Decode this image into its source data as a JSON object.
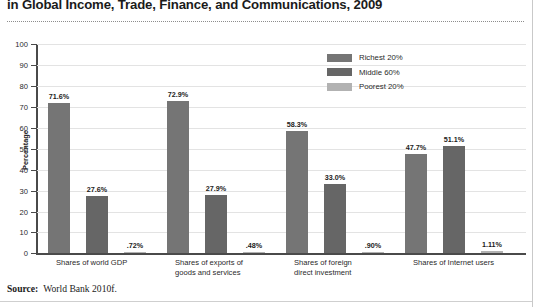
{
  "figure": {
    "title": "in Global Income, Trade, Finance, and Communications, 2009",
    "source_label": "Source:",
    "source_text": "World Bank 2010f."
  },
  "chart_data": {
    "type": "bar",
    "title": "in Global Income, Trade, Finance, and Communications, 2009",
    "xlabel": "",
    "ylabel": "Percentage",
    "ylim": [
      0,
      100
    ],
    "yticks": [
      0,
      10,
      20,
      30,
      40,
      50,
      60,
      70,
      80,
      90,
      100
    ],
    "ytick_labels": [
      "0",
      "10",
      "20",
      "30",
      "40",
      "50",
      "60",
      "70",
      "80",
      "90",
      "100"
    ],
    "grid": true,
    "legend_position": "top-right",
    "categories": [
      "Shares of world GDP",
      "Shares of exports of\ngoods and services",
      "Shares of foreign\ndirect investment",
      "Shares of Internet users"
    ],
    "series": [
      {
        "name": "Richest 20%",
        "color": "#757575",
        "values": [
          71.6,
          72.9,
          58.3,
          47.7
        ],
        "value_labels": [
          "71.6%",
          "72.9%",
          "58.3%",
          "47.7%"
        ]
      },
      {
        "name": "Middle 60%",
        "color": "#666666",
        "values": [
          27.6,
          27.9,
          33.0,
          51.1
        ],
        "value_labels": [
          "27.6%",
          "27.9%",
          "33.0%",
          "51.1%"
        ]
      },
      {
        "name": "Poorest 20%",
        "color": "#b2b2b2",
        "values": [
          0.72,
          0.48,
          0.9,
          1.11
        ],
        "value_labels": [
          ".72%",
          ".48%",
          ".90%",
          "1.11%"
        ]
      }
    ]
  },
  "legend": {
    "items": [
      {
        "label": "Richest 20%",
        "color": "#757575"
      },
      {
        "label": "Middle 60%",
        "color": "#666666"
      },
      {
        "label": "Poorest 20%",
        "color": "#b2b2b2"
      }
    ]
  },
  "axis": {
    "y_title": "Percentage",
    "y_labels": [
      "100",
      "90",
      "80",
      "70",
      "60",
      "50",
      "40",
      "30",
      "20",
      "10",
      "0"
    ]
  }
}
